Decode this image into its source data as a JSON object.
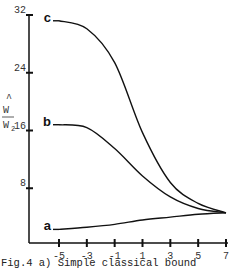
{
  "chart_data": {
    "type": "line",
    "title": "",
    "caption": "Fig.4  a) Simple classical bound",
    "xlabel": "",
    "ylabel": "Ŵ/W₂",
    "ylabel_num": "W",
    "ylabel_hat": "^",
    "ylabel_den": "W",
    "ylabel_sub": "2",
    "x": [
      -5,
      -3,
      -1,
      1,
      3,
      5,
      7
    ],
    "xlim": [
      -5,
      7
    ],
    "ylim": [
      0,
      32
    ],
    "xticks": [
      -5,
      -3,
      -1,
      1,
      3,
      5,
      7
    ],
    "xtick_labels": [
      "-5",
      "-3",
      "-1",
      "1",
      "3",
      "5",
      "7"
    ],
    "yticks": [
      8,
      16,
      24,
      32
    ],
    "ytick_labels": [
      "8",
      "16",
      "24",
      "32"
    ],
    "grid": false,
    "legend": "none",
    "series": [
      {
        "name": "c",
        "values": [
          31.2,
          30.1,
          25.4,
          15.7,
          8.8,
          5.9,
          4.6
        ]
      },
      {
        "name": "b",
        "values": [
          16.8,
          16.4,
          13.5,
          9.7,
          6.8,
          5.2,
          4.6
        ]
      },
      {
        "name": "a",
        "values": [
          2.3,
          2.6,
          3.0,
          3.6,
          4.0,
          4.4,
          4.6
        ]
      }
    ]
  }
}
